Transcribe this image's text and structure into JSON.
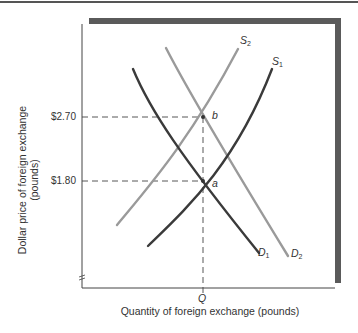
{
  "diagram": {
    "title": "",
    "y_axis": {
      "label_line1": "Dollar price of foreign exchange",
      "label_line2": "(pounds)",
      "ticks": [
        {
          "label": "$2.70",
          "value": 2.7
        },
        {
          "label": "$1.80",
          "value": 1.8
        }
      ],
      "axis_break": "≈"
    },
    "x_axis": {
      "label": "Quantity of foreign exchange (pounds)",
      "ticks": [
        {
          "label": "Q"
        }
      ]
    },
    "curves": [
      {
        "id": "S1",
        "letter": "S",
        "subscript": "1",
        "type": "supply",
        "shade": "dark",
        "color": "#3a3a3a"
      },
      {
        "id": "S2",
        "letter": "S",
        "subscript": "2",
        "type": "supply",
        "shade": "light",
        "color": "#9a9a9a"
      },
      {
        "id": "D1",
        "letter": "D",
        "subscript": "1",
        "type": "demand",
        "shade": "dark",
        "color": "#3a3a3a"
      },
      {
        "id": "D2",
        "letter": "D",
        "subscript": "2",
        "type": "demand",
        "shade": "light",
        "color": "#9a9a9a"
      }
    ],
    "points": [
      {
        "label": "a",
        "price": "$1.80",
        "quantity": "Q",
        "intersection": "S1 and D1"
      },
      {
        "label": "b",
        "price": "$2.70",
        "quantity": "Q",
        "intersection": "S2 and D2"
      }
    ],
    "colors": {
      "dark_curve": "#3a3a3a",
      "light_curve": "#9a9a9a",
      "frame_shadow": "#5a5a5a",
      "dashed_guides": "#444444"
    }
  }
}
